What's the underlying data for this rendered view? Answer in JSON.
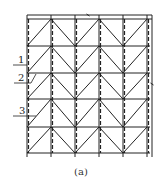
{
  "figure": {
    "caption": "(a)",
    "labels": [
      {
        "id": "1",
        "text": "1",
        "x": 18,
        "y": 63,
        "leader": [
          [
            13,
            65
          ],
          [
            27,
            65
          ]
        ]
      },
      {
        "id": "2",
        "text": "2",
        "x": 18,
        "y": 81,
        "leader": [
          [
            14,
            83
          ],
          [
            31,
            83
          ],
          [
            36,
            74
          ]
        ]
      },
      {
        "id": "3",
        "text": "3",
        "x": 19,
        "y": 114,
        "leader": [
          [
            13,
            116
          ],
          [
            36,
            116
          ]
        ]
      }
    ],
    "grid": {
      "columns_x": [
        27,
        51,
        75,
        99,
        123,
        147
      ],
      "rows_y": [
        19,
        46,
        73,
        99,
        127,
        153
      ],
      "top_line_y": 15,
      "right_edge_x": 152,
      "bottom_ext_y": 157,
      "dashed_columns_x": [
        27,
        51,
        75,
        99,
        123,
        147
      ],
      "peaks_x": [
        51,
        99,
        147
      ],
      "valleys_x": [
        27,
        75,
        123
      ]
    },
    "marks": [
      {
        "type": "tick",
        "x": 88,
        "y": 15
      },
      {
        "type": "tick",
        "x": 152,
        "y": 84
      }
    ],
    "colors": {
      "line": "#222222",
      "background": "#ffffff"
    }
  }
}
